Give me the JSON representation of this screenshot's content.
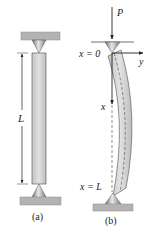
{
  "figure": {
    "panel_a": {
      "caption": "(a)",
      "dimension_label": "L"
    },
    "panel_b": {
      "caption": "(b)",
      "load_label": "P",
      "top_label": "x = 0",
      "bottom_label": "x = L",
      "axis_x_label": "x",
      "axis_y_label": "y"
    },
    "colors": {
      "column_fill": "#d4d4d4",
      "column_stroke": "#555555",
      "plate_fill": "#b0b0b0",
      "cone_fill": "#a8a8a8",
      "line": "#222222"
    }
  }
}
